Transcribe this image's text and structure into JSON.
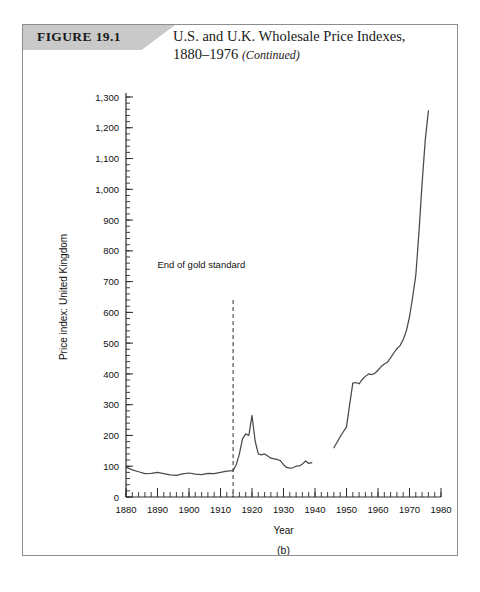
{
  "figure": {
    "tab_label": "FIGURE 19.1",
    "title_line1": "U.S. and U.K. Wholesale Price Indexes,",
    "title_line2": "1880–1976",
    "title_continued": "(Continued)"
  },
  "chart_data": {
    "type": "line",
    "title": "U.S. and U.K. Wholesale Price Indexes, 1880–1976 (Continued)",
    "panel_label": "(b)",
    "xlabel": "Year",
    "ylabel": "Price index: United Kingdom",
    "xlim": [
      1880,
      1980
    ],
    "ylim": [
      0,
      1300
    ],
    "x_ticks": [
      1880,
      1890,
      1900,
      1910,
      1920,
      1930,
      1940,
      1950,
      1960,
      1970,
      1980
    ],
    "x_tick_labels": [
      "1880",
      "1890",
      "1900",
      "1910",
      "1920",
      "1930",
      "1940",
      "1950",
      "1960",
      "1970",
      "1980"
    ],
    "x_minor_tick_interval": 2,
    "y_ticks": [
      0,
      100,
      200,
      300,
      400,
      500,
      600,
      700,
      800,
      900,
      1000,
      1100,
      1200,
      1300
    ],
    "y_tick_labels": [
      "0",
      "100",
      "200",
      "300",
      "400",
      "500",
      "600",
      "700",
      "800",
      "900",
      "1,000",
      "1,100",
      "1,200",
      "1,300"
    ],
    "y_minor_tick_interval": 20,
    "grid": false,
    "legend": "none",
    "annotations": [
      {
        "text": "End of gold standard",
        "x": 1914,
        "label_x": 1890,
        "label_y": 745,
        "line_from_y": 640,
        "line_to_y": 0,
        "style": "dashed-vertical"
      }
    ],
    "series": [
      {
        "name": "Price index: United Kingdom (1880–1939)",
        "segment": 1,
        "x": [
          1880,
          1882,
          1884,
          1886,
          1888,
          1890,
          1892,
          1894,
          1896,
          1898,
          1900,
          1902,
          1904,
          1906,
          1908,
          1910,
          1912,
          1913,
          1914,
          1915,
          1916,
          1917,
          1918,
          1919,
          1920,
          1921,
          1922,
          1923,
          1924,
          1925,
          1926,
          1927,
          1928,
          1929,
          1930,
          1931,
          1932,
          1933,
          1934,
          1935,
          1936,
          1937,
          1938,
          1939
        ],
        "y": [
          97,
          88,
          82,
          76,
          77,
          80,
          76,
          72,
          70,
          75,
          78,
          74,
          73,
          77,
          76,
          80,
          84,
          85,
          86,
          105,
          140,
          190,
          205,
          200,
          265,
          182,
          140,
          137,
          140,
          133,
          126,
          124,
          122,
          118,
          105,
          96,
          94,
          95,
          100,
          101,
          107,
          117,
          109,
          112
        ]
      },
      {
        "name": "Price index: United Kingdom (1946–1976)",
        "segment": 2,
        "x": [
          1946,
          1947,
          1948,
          1949,
          1950,
          1951,
          1952,
          1953,
          1954,
          1955,
          1956,
          1957,
          1958,
          1959,
          1960,
          1961,
          1962,
          1963,
          1964,
          1965,
          1966,
          1967,
          1968,
          1969,
          1970,
          1971,
          1972,
          1973,
          1974,
          1975,
          1976
        ],
        "y": [
          160,
          178,
          196,
          212,
          228,
          300,
          370,
          372,
          368,
          382,
          392,
          400,
          398,
          402,
          412,
          424,
          432,
          438,
          452,
          468,
          482,
          492,
          512,
          540,
          585,
          650,
          720,
          860,
          1020,
          1160,
          1255
        ]
      }
    ]
  }
}
